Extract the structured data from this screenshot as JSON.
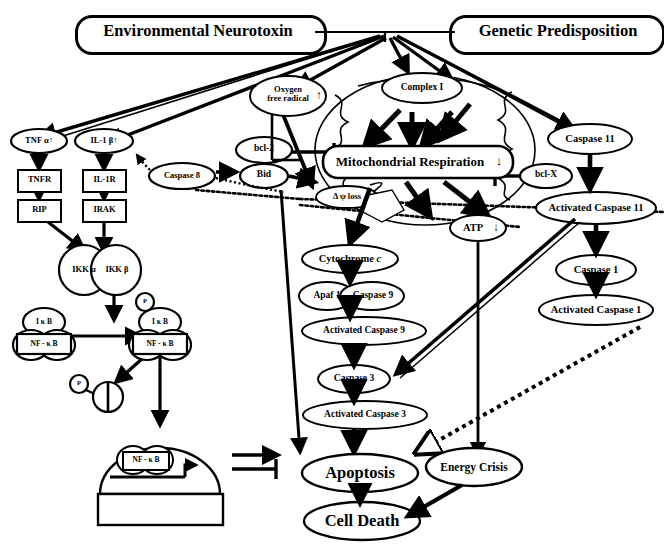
{
  "figure": {
    "type": "biological-pathway-diagram",
    "background": "#ffffff",
    "stroke": "#000000"
  },
  "stimuli": {
    "environmental": "Environmental   Neurotoxin",
    "genetic": "Genetic   Predisposition"
  },
  "inflammatory": {
    "tnf": "TNF α",
    "il1b": "IL-1 β",
    "tnfr": "TNFR",
    "il1r": "IL-1R",
    "rip": "RIP",
    "irak": "IRAK",
    "ikk_alpha": "IKK α",
    "ikk_beta": "IKK β",
    "ikb_1": "I κ B",
    "nfkb_1": "NF - κ B",
    "ikb_2": "I κ B",
    "nfkb_2": "NF - κ B",
    "phospho_1": "P",
    "phospho_2": "P",
    "phospho_3": "P",
    "nfkb_nucleus": "NF - κ B"
  },
  "mitochondrion": {
    "oxygen_free_radical_line1": "Oxygen",
    "oxygen_free_radical_line2": "free   radical",
    "complex_i": "Complex I",
    "respiration": "Mitochondrial  Respiration",
    "psi_loss": "Δ ψ loss",
    "atp": "ATP",
    "bcl2": "bcl-2",
    "bid": "Bid",
    "bclx": "bcl-X"
  },
  "caspase_cascade": {
    "caspase8": "Caspase 8",
    "cytochrome_c_label": "Cytochrome",
    "cytochrome_c_italic": "c",
    "apaf1": "Apaf 1",
    "caspase9": "Caspase 9",
    "activated_caspase9": "Activated    Caspase 9",
    "caspase3": "Caspase 3",
    "activated_caspase3": "Activated    Caspase 3",
    "caspase11": "Caspase 11",
    "activated_caspase11": "Activated Caspase 11",
    "caspase1": "Caspase 1",
    "activated_caspase1": "Activated Caspase 1"
  },
  "outcomes": {
    "apoptosis": "Apoptosis",
    "energy_crisis": "Energy   Crisis",
    "cell_death": "Cell   Death"
  },
  "arrow_glyphs": {
    "up": "↑",
    "down": "↓"
  }
}
